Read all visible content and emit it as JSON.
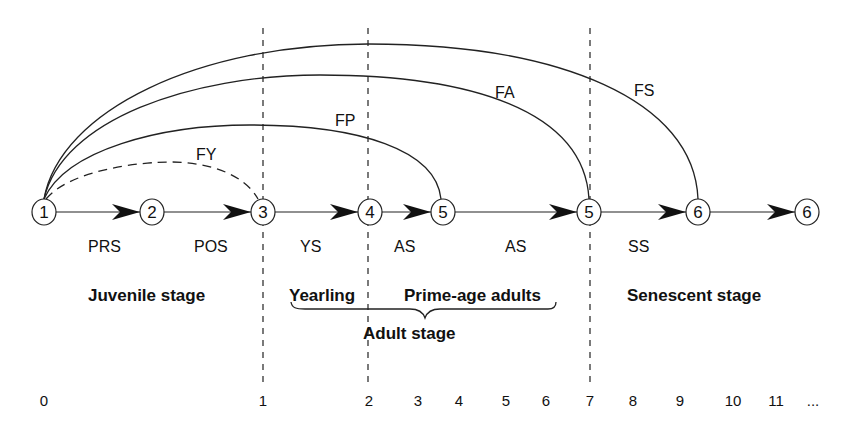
{
  "diagram": {
    "type": "life-cycle graph",
    "nodes": [
      {
        "id": "n1",
        "label": "1",
        "x": 44
      },
      {
        "id": "n2",
        "label": "2",
        "x": 152
      },
      {
        "id": "n3",
        "label": "3",
        "x": 263
      },
      {
        "id": "n4",
        "label": "4",
        "x": 370
      },
      {
        "id": "n5a",
        "label": "5",
        "x": 443
      },
      {
        "id": "n5b",
        "label": "5",
        "x": 589
      },
      {
        "id": "n6a",
        "label": "6",
        "x": 698
      },
      {
        "id": "n6b",
        "label": "6",
        "x": 807
      }
    ],
    "transitions": [
      {
        "from": "n1",
        "to": "n2",
        "label": "PRS",
        "label_x": 88
      },
      {
        "from": "n2",
        "to": "n3",
        "label": "POS",
        "label_x": 194
      },
      {
        "from": "n3",
        "to": "n4",
        "label": "YS",
        "label_x": 300
      },
      {
        "from": "n4",
        "to": "n5a",
        "label": "AS",
        "label_x": 394
      },
      {
        "from": "n5a",
        "to": "n5b",
        "label": "AS",
        "label_x": 505
      },
      {
        "from": "n5b",
        "to": "n6a",
        "label": "SS",
        "label_x": 628
      },
      {
        "from": "n6a",
        "to": "n6b",
        "label": "",
        "label_x": 0
      }
    ],
    "fecundity_arcs": [
      {
        "label": "FY",
        "to": "n3",
        "style": "dashed"
      },
      {
        "label": "FP",
        "to": "n5a",
        "style": "solid"
      },
      {
        "label": "FA",
        "to": "n5b",
        "style": "solid"
      },
      {
        "label": "FS",
        "to": "n6a",
        "style": "solid"
      }
    ],
    "stages": {
      "juvenile": "Juvenile stage",
      "yearling": "Yearling",
      "prime_age": "Prime-age adults",
      "adult": "Adult stage",
      "senescent": "Senescent stage"
    },
    "age_axis": {
      "ticks": [
        {
          "label": "0",
          "x": 44
        },
        {
          "label": "1",
          "x": 263
        },
        {
          "label": "2",
          "x": 369
        },
        {
          "label": "3",
          "x": 418
        },
        {
          "label": "4",
          "x": 459
        },
        {
          "label": "5",
          "x": 506
        },
        {
          "label": "6",
          "x": 546
        },
        {
          "label": "7",
          "x": 590
        },
        {
          "label": "8",
          "x": 633
        },
        {
          "label": "9",
          "x": 680
        },
        {
          "label": "10",
          "x": 733
        },
        {
          "label": "11",
          "x": 776
        },
        {
          "label": "...",
          "x": 813
        }
      ]
    }
  }
}
